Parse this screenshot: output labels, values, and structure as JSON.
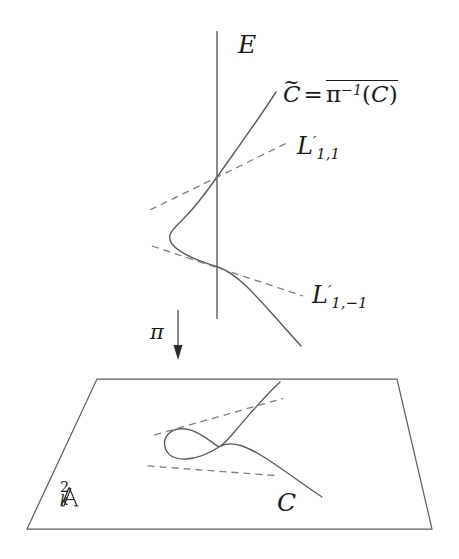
{
  "figure": {
    "width": 459,
    "height": 559,
    "background_color": "#ffffff",
    "stroke_color": "#4a4a4a",
    "label_color": "#1a1a1a"
  },
  "labels": {
    "exceptional_divisor": "E",
    "upper_curve": {
      "c_tilde": "C",
      "tilde_accent": "~",
      "equals": "=",
      "pi": "π",
      "pi_exponent": "−1",
      "closure_open": "(",
      "closure_arg": "C",
      "closure_close": ")"
    },
    "tangent_line_upper": {
      "base": "L",
      "prime": "′",
      "sub": "1,1"
    },
    "tangent_line_lower": {
      "base": "L",
      "prime": "′",
      "sub": "1,−1"
    },
    "projection_map": "π",
    "plane": {
      "base": "A",
      "sup": "2",
      "sub": "k"
    },
    "plane_curve": "C"
  },
  "geometry": {
    "exceptional_line": {
      "x": 217,
      "y_top": 31,
      "y_bottom": 319
    },
    "upper_curve_intersections": [
      {
        "x": 217,
        "y": 174
      },
      {
        "x": 218,
        "y": 267
      }
    ],
    "upper_curve_endpoints": [
      {
        "x": 276,
        "y": 92
      },
      {
        "x": 301,
        "y": 346
      }
    ],
    "tangent_upper_endpoints": [
      {
        "x": 150,
        "y": 210
      },
      {
        "x": 289,
        "y": 142
      }
    ],
    "tangent_lower_endpoints": [
      {
        "x": 152,
        "y": 246
      },
      {
        "x": 303,
        "y": 296
      }
    ],
    "projection_arrow": {
      "x": 178,
      "y_top": 310,
      "y_bottom": 359
    },
    "plane_corners": [
      {
        "x": 97,
        "y": 379
      },
      {
        "x": 397,
        "y": 379
      },
      {
        "x": 432,
        "y": 529
      },
      {
        "x": 27,
        "y": 529
      }
    ],
    "plane_node": {
      "x": 219,
      "y": 447
    },
    "plane_loop_left_extent": {
      "x": 165,
      "y": 448
    },
    "plane_curve_endpoints": [
      {
        "x": 280,
        "y": 382
      },
      {
        "x": 322,
        "y": 497
      }
    ],
    "plane_tangent_a_endpoints": [
      {
        "x": 157,
        "y": 425
      },
      {
        "x": 290,
        "y": 409
      }
    ],
    "plane_tangent_b_endpoints": [
      {
        "x": 152,
        "y": 478
      },
      {
        "x": 283,
        "y": 465
      }
    ]
  },
  "style": {
    "solid_stroke_width": 1.3,
    "dashed_stroke_width": 1.3,
    "dash_pattern": "7 5",
    "plane_stroke_width": 1.2
  }
}
